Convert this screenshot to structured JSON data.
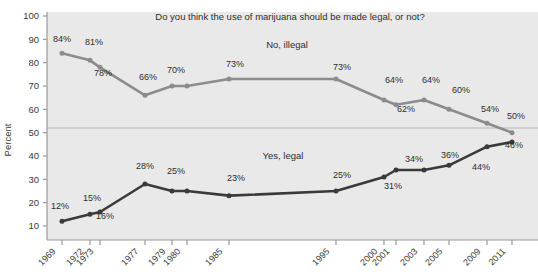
{
  "chart_data": {
    "type": "line",
    "title": "Do you think the use of marijuana should be made legal, or not?",
    "xlabel": "",
    "ylabel": "Percent",
    "ylim": [
      0,
      100
    ],
    "yticks": [
      10,
      20,
      30,
      40,
      50,
      60,
      70,
      80,
      90,
      100
    ],
    "grid": "single horizontal gridline at 50",
    "legend_position": "inline-series-labels",
    "categories": [
      "1969",
      "1972",
      "1973",
      "1977",
      "1979",
      "1980",
      "1985",
      "1995",
      "2000",
      "2001",
      "2003",
      "2005",
      "2009",
      "2011"
    ],
    "series": [
      {
        "name": "No, illegal",
        "color": "#8c8c8c",
        "values": [
          84,
          81,
          78,
          66,
          70,
          70,
          73,
          73,
          64,
          62,
          64,
          60,
          54,
          50
        ],
        "labels": [
          "84%",
          "81%",
          "78%",
          "66%",
          "70%",
          "",
          "73%",
          "73%",
          "64%",
          "62%",
          "64%",
          "60%",
          "54%",
          "50%"
        ]
      },
      {
        "name": "Yes, legal",
        "color": "#3a3a3a",
        "values": [
          12,
          15,
          16,
          28,
          25,
          25,
          23,
          25,
          31,
          34,
          34,
          36,
          44,
          46
        ],
        "labels": [
          "12%",
          "15%",
          "16%",
          "28%",
          "25%",
          "",
          "23%",
          "25%",
          "31%",
          "34%",
          "",
          "36%",
          "44%",
          "46%"
        ]
      }
    ]
  },
  "axis": {
    "y_title": "Percent",
    "y_tick_labels": [
      "100",
      "90",
      "80",
      "70",
      "60",
      "50",
      "40",
      "30",
      "20",
      "10"
    ],
    "x_tick_labels": [
      "1969",
      "1972",
      "1973",
      "1977",
      "1979",
      "1980",
      "1985",
      "1995",
      "2000",
      "2001",
      "2003",
      "2005",
      "2009",
      "2011"
    ]
  },
  "series_labels": {
    "upper": "No, illegal",
    "lower": "Yes, legal"
  },
  "data_labels": {
    "illegal": {
      "l1969": "84%",
      "l1972": "81%",
      "l1973": "78%",
      "l1977": "66%",
      "l1979": "70%",
      "l1985": "73%",
      "l1995": "73%",
      "l2000": "64%",
      "l2001": "62%",
      "l2003": "64%",
      "l2005": "60%",
      "l2009": "54%",
      "l2011": "50%"
    },
    "legal": {
      "l1969": "12%",
      "l1972": "15%",
      "l1973": "16%",
      "l1977": "28%",
      "l1979": "25%",
      "l1985": "23%",
      "l1995": "25%",
      "l2000": "31%",
      "l2001": "34%",
      "l2005": "36%",
      "l2009": "44%",
      "l2011": "46%"
    }
  },
  "colors": {
    "plot_background": "#e9e9e9",
    "page_background": "#ffffff",
    "illegal_line": "#8c8c8c",
    "legal_line": "#3a3a3a",
    "axis": "#9a9a9a",
    "gridline": "#b5b5b5",
    "text": "#2d2d2d"
  }
}
